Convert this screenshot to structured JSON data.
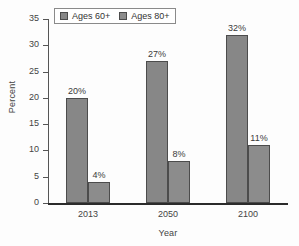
{
  "chart_data": {
    "type": "bar",
    "title": "",
    "xlabel": "Year",
    "ylabel": "Percent",
    "categories": [
      "2013",
      "2050",
      "2100"
    ],
    "series": [
      {
        "name": "Ages 60+",
        "values": [
          20,
          27,
          32
        ],
        "labels": [
          "20%",
          "27%",
          "32%"
        ],
        "color": "#878787"
      },
      {
        "name": "Ages 80+",
        "values": [
          4,
          8,
          11
        ],
        "labels": [
          "4%",
          "8%",
          "11%"
        ],
        "color": "#8c8c8c"
      }
    ],
    "ylim": [
      0,
      35
    ],
    "yticks": [
      0,
      5,
      10,
      15,
      20,
      25,
      30,
      35
    ],
    "ytick_labels": [
      "0",
      "5",
      "10",
      "15",
      "20",
      "25",
      "30",
      "35"
    ],
    "grid": false,
    "legend_position": "top-left",
    "axis_color": "#2b2b2b",
    "text_color": "#444444"
  }
}
